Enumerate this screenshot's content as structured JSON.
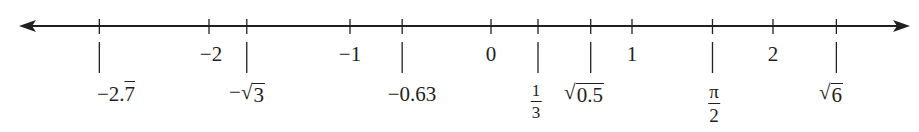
{
  "chart_data": {
    "type": "number_line",
    "title": "",
    "xlim": [
      -3.4,
      2.97
    ],
    "arrows": [
      "left",
      "right"
    ],
    "integer_ticks": [
      {
        "value": -2,
        "label": "−2"
      },
      {
        "value": -1,
        "label": "−1"
      },
      {
        "value": 0,
        "label": "0"
      },
      {
        "value": 1,
        "label": "1"
      },
      {
        "value": 2,
        "label": "2"
      }
    ],
    "marked_points": [
      {
        "value": -2.7777,
        "label": "−2.7̄",
        "display": {
          "prefix": "−2.",
          "overline": "7"
        }
      },
      {
        "value": -1.7321,
        "label": "−√3",
        "display": {
          "prefix": "−",
          "radicand": "3"
        }
      },
      {
        "value": -0.63,
        "label": "−0.63",
        "display": {
          "text": "−0.63"
        }
      },
      {
        "value": 0.3333,
        "label": "1/3",
        "display": {
          "numerator": "1",
          "denominator": "3"
        }
      },
      {
        "value": 0.7071,
        "label": "√0.5",
        "display": {
          "radicand": "0.5"
        }
      },
      {
        "value": 1.5708,
        "label": "π/2",
        "display": {
          "numerator": "π",
          "denominator": "2"
        }
      },
      {
        "value": 2.4495,
        "label": "√6",
        "display": {
          "radicand": "6"
        }
      }
    ]
  },
  "colors": {
    "ink": "#231f20",
    "background": "#ffffff"
  }
}
